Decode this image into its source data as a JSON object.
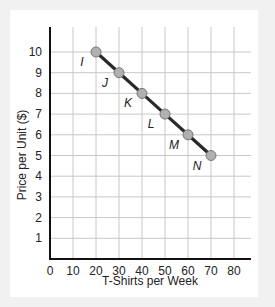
{
  "chart_data": {
    "type": "line",
    "title": "",
    "xlabel": "T-Shirts per Week",
    "ylabel": "Price per Unit ($)",
    "xlim": [
      0,
      88
    ],
    "ylim": [
      0,
      11
    ],
    "xticks": [
      0,
      10,
      20,
      30,
      40,
      50,
      60,
      70,
      80
    ],
    "yticks": [
      1,
      2,
      3,
      4,
      5,
      6,
      7,
      8,
      9,
      10
    ],
    "grid": true,
    "series": [
      {
        "name": "Demand",
        "points": [
          {
            "label": "I",
            "x": 20,
            "y": 10
          },
          {
            "label": "J",
            "x": 30,
            "y": 9
          },
          {
            "label": "K",
            "x": 40,
            "y": 8
          },
          {
            "label": "L",
            "x": 50,
            "y": 7
          },
          {
            "label": "M",
            "x": 60,
            "y": 6
          },
          {
            "label": "N",
            "x": 70,
            "y": 5
          }
        ]
      }
    ]
  }
}
